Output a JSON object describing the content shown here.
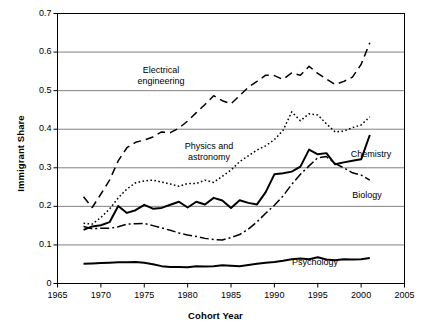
{
  "chart_data": {
    "type": "line",
    "title": "",
    "xlabel": "Cohort Year",
    "ylabel": "Immigrant Share",
    "xlim": [
      1965,
      2005
    ],
    "ylim": [
      0,
      0.7
    ],
    "xticks": [
      "1965",
      "1970",
      "1975",
      "1980",
      "1985",
      "1990",
      "1995",
      "2000",
      "2005"
    ],
    "xtick_values": [
      1965,
      1970,
      1975,
      1980,
      1985,
      1990,
      1995,
      2000,
      2005
    ],
    "yticks": [
      "0",
      "0.1",
      "0.2",
      "0.3",
      "0.4",
      "0.5",
      "0.6",
      "0.7"
    ],
    "ytick_values": [
      0,
      0.1,
      0.2,
      0.3,
      0.4,
      0.5,
      0.6,
      0.7
    ],
    "grid": "horizontal",
    "legend_position": "inline-annotations",
    "x": [
      1968,
      1969,
      1970,
      1971,
      1972,
      1973,
      1974,
      1975,
      1976,
      1977,
      1978,
      1979,
      1980,
      1981,
      1982,
      1983,
      1984,
      1985,
      1986,
      1987,
      1988,
      1989,
      1990,
      1991,
      1992,
      1993,
      1994,
      1995,
      1996,
      1997,
      1998,
      1999,
      2000,
      2001
    ],
    "series": [
      {
        "name": "Electrical engineering",
        "dash": "8,5",
        "width": 1.5,
        "color": "#000000",
        "values": [
          0.225,
          0.197,
          0.232,
          0.268,
          0.318,
          0.352,
          0.366,
          0.372,
          0.38,
          0.393,
          0.391,
          0.403,
          0.421,
          0.443,
          0.464,
          0.487,
          0.474,
          0.466,
          0.487,
          0.509,
          0.524,
          0.54,
          0.539,
          0.529,
          0.546,
          0.54,
          0.563,
          0.545,
          0.53,
          0.516,
          0.524,
          0.535,
          0.568,
          0.624
        ]
      },
      {
        "name": "Physics and astronomy",
        "dash": "1.6,2.4",
        "width": 1.5,
        "color": "#000000",
        "values": [
          0.156,
          0.154,
          0.171,
          0.193,
          0.222,
          0.245,
          0.261,
          0.266,
          0.268,
          0.263,
          0.258,
          0.252,
          0.259,
          0.259,
          0.268,
          0.262,
          0.278,
          0.294,
          0.316,
          0.331,
          0.346,
          0.357,
          0.373,
          0.397,
          0.445,
          0.422,
          0.44,
          0.437,
          0.414,
          0.393,
          0.395,
          0.404,
          0.411,
          0.432
        ]
      },
      {
        "name": "Chemistry",
        "dash": "none",
        "width": 2.0,
        "color": "#000000",
        "values": [
          0.139,
          0.148,
          0.151,
          0.159,
          0.201,
          0.183,
          0.19,
          0.204,
          0.194,
          0.196,
          0.204,
          0.212,
          0.197,
          0.212,
          0.205,
          0.222,
          0.215,
          0.196,
          0.216,
          0.209,
          0.205,
          0.237,
          0.283,
          0.286,
          0.29,
          0.303,
          0.347,
          0.335,
          0.338,
          0.309,
          0.314,
          0.318,
          0.322,
          0.385
        ]
      },
      {
        "name": "Biology",
        "dash": "9,3,2,3",
        "width": 1.5,
        "color": "#000000",
        "values": [
          0.148,
          0.142,
          0.143,
          0.143,
          0.147,
          0.154,
          0.155,
          0.156,
          0.15,
          0.144,
          0.138,
          0.131,
          0.126,
          0.122,
          0.117,
          0.114,
          0.113,
          0.119,
          0.127,
          0.141,
          0.16,
          0.182,
          0.203,
          0.227,
          0.257,
          0.283,
          0.305,
          0.326,
          0.329,
          0.311,
          0.3,
          0.287,
          0.281,
          0.268
        ]
      },
      {
        "name": "Psychology",
        "dash": "none",
        "width": 2.0,
        "color": "#000000",
        "values": [
          0.051,
          0.052,
          0.053,
          0.054,
          0.055,
          0.055,
          0.056,
          0.054,
          0.05,
          0.045,
          0.043,
          0.043,
          0.042,
          0.045,
          0.044,
          0.045,
          0.047,
          0.046,
          0.045,
          0.048,
          0.051,
          0.054,
          0.056,
          0.059,
          0.063,
          0.065,
          0.063,
          0.068,
          0.062,
          0.06,
          0.063,
          0.062,
          0.063,
          0.066
        ]
      }
    ],
    "annotations": [
      {
        "text_line1": "Electrical",
        "text_line2": "engineering",
        "x": 161,
        "y": 65
      },
      {
        "text_line1": "Physics and",
        "text_line2": "astronomy",
        "x": 209,
        "y": 141
      },
      {
        "text_line1": "Chemistry",
        "text_line2": "",
        "x": 371,
        "y": 149
      },
      {
        "text_line1": "Biology",
        "text_line2": "",
        "x": 367,
        "y": 190
      },
      {
        "text_line1": "Psychology",
        "text_line2": "",
        "x": 315,
        "y": 257
      }
    ]
  },
  "style": {
    "frame_color": "#000000",
    "grid_color": "#808080",
    "background": "#ffffff"
  }
}
